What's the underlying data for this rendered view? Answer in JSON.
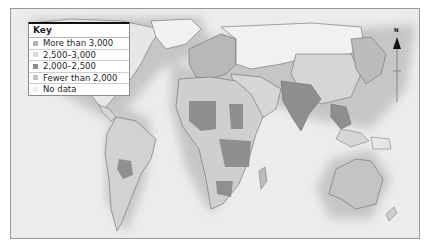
{
  "map": {
    "type": "choropleth world map",
    "colors": {
      "ocean": "#ececec",
      "more_than_3000": "#b5b5b5",
      "2500_3000": "#cfcfcf",
      "2000_2500": "#8f8f8f",
      "fewer_than_2000": "#bdbdbd",
      "no_data": "#f3f3f3",
      "border": "#6b6b6b"
    }
  },
  "key": {
    "title": "Key",
    "items": [
      {
        "label": "More than 3,000",
        "color": "#b5b5b5"
      },
      {
        "label": "2,500–3,000",
        "color": "#d6d6d6"
      },
      {
        "label": "2,000–2,500",
        "color": "#8f8f8f"
      },
      {
        "label": "Fewer than 2,000",
        "color": "#c4c4c4"
      },
      {
        "label": "No data",
        "color": "#efefef"
      }
    ]
  },
  "north_arrow": {
    "label": "N",
    "icon": "north-arrow-icon"
  }
}
